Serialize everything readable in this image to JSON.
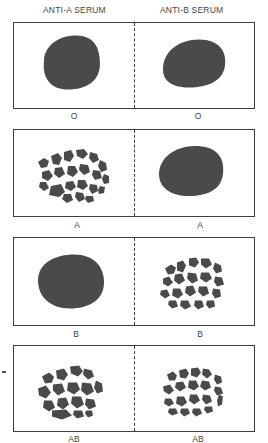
{
  "headers": {
    "left": "ANTI-A SERUM",
    "right": "ANTI-B SERUM"
  },
  "colors": {
    "blob": "#4a4a4a",
    "border": "#3e3e3e",
    "text": "#444444"
  },
  "rows": [
    {
      "blood_type": "O",
      "left_label": "O",
      "right_label": "O",
      "left_result": "no agglutination",
      "right_result": "no agglutination"
    },
    {
      "blood_type": "A",
      "left_label": "A",
      "right_label": "A",
      "left_result": "agglutination",
      "right_result": "no agglutination"
    },
    {
      "blood_type": "B",
      "left_label": "B",
      "right_label": "B",
      "left_result": "no agglutination",
      "right_result": "agglutination"
    },
    {
      "blood_type": "AB",
      "left_label": "AB",
      "right_label": "AB",
      "left_result": "agglutination",
      "right_result": "agglutination"
    }
  ]
}
